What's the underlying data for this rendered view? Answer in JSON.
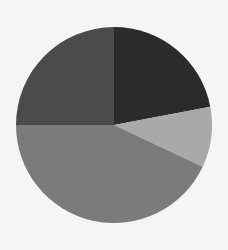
{
  "chart_data": {
    "type": "pie",
    "title": "",
    "legend": [],
    "start_angle_deg_from_top": 0,
    "direction": "clockwise",
    "slices": [
      {
        "label": "",
        "value": 22,
        "color": "#2b2b2b"
      },
      {
        "label": "",
        "value": 10,
        "color": "#a9a9a9"
      },
      {
        "label": "",
        "value": 43,
        "color": "#7b7b7b"
      },
      {
        "label": "",
        "value": 25,
        "color": "#4b4b4b"
      }
    ],
    "values": [
      22,
      10,
      43,
      25
    ],
    "center": [
      114,
      125
    ],
    "radius": 98
  }
}
